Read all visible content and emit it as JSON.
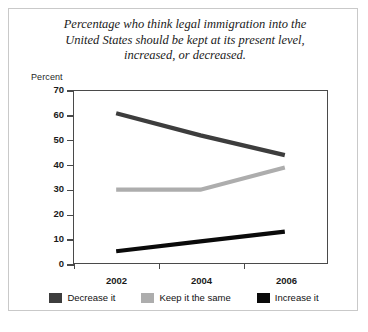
{
  "chart_data": {
    "type": "line",
    "title": "Percentage who think legal immigration into the United States should be kept at its present level, increased, or decreased.",
    "title_lines": [
      "Percentage who think legal immigration into the",
      "United States should be kept at its present level,",
      "increased, or decreased."
    ],
    "xlabel": "",
    "ylabel": "Percent",
    "categories": [
      "2002",
      "2004",
      "2006"
    ],
    "x": [
      2002,
      2004,
      2006
    ],
    "ylim": [
      0,
      70
    ],
    "yticks": [
      70,
      60,
      50,
      40,
      30,
      20,
      10,
      0
    ],
    "grid": false,
    "legend_position": "bottom",
    "series": [
      {
        "name": "Decrease it",
        "values": [
          61,
          52,
          44
        ],
        "color": "#3d3d3d"
      },
      {
        "name": "Keep it the same",
        "values": [
          30,
          30,
          39
        ],
        "color": "#adadad"
      },
      {
        "name": "Increase it",
        "values": [
          5,
          9,
          13
        ],
        "color": "#0a0a0a"
      }
    ]
  },
  "legend": {
    "items": [
      {
        "label": "Decrease it",
        "color": "#3d3d3d"
      },
      {
        "label": "Keep it the same",
        "color": "#adadad"
      },
      {
        "label": "Increase it",
        "color": "#0a0a0a"
      }
    ]
  },
  "source": {
    "text": ""
  }
}
